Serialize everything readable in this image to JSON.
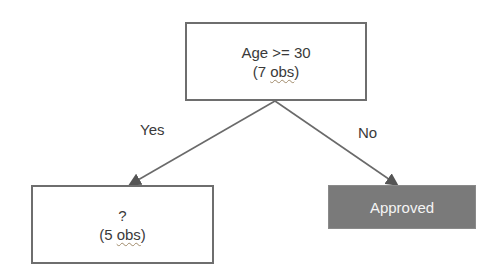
{
  "diagram": {
    "type": "decision-tree",
    "root": {
      "condition": "Age >= 30",
      "obs_prefix": "(7 ",
      "obs_word": "obs",
      "obs_suffix": ")"
    },
    "branches": [
      {
        "label": "Yes",
        "target": "left"
      },
      {
        "label": "No",
        "target": "right"
      }
    ],
    "left": {
      "title": "?",
      "obs_prefix": "(5 ",
      "obs_word": "obs",
      "obs_suffix": ")"
    },
    "right": {
      "title": "Approved"
    },
    "colors": {
      "border": "#6e6e6e",
      "leaf_fill": "#7a7a7a",
      "leaf_text": "#f4f4f4",
      "text": "#3a3a3a"
    }
  }
}
